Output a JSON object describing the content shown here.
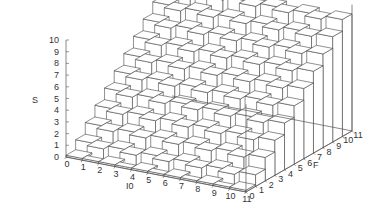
{
  "chart_data": {
    "type": "surface3d",
    "style": "stepped boxes (hidden-line)",
    "title": "",
    "xlabel": "I0",
    "ylabel": "F",
    "zlabel": "S",
    "x_ticks": [
      0,
      1,
      2,
      3,
      4,
      5,
      6,
      7,
      8,
      9,
      10,
      11
    ],
    "y_ticks": [
      0,
      1,
      2,
      3,
      4,
      5,
      6,
      7,
      8,
      9,
      10,
      11
    ],
    "z_ticks": [
      0,
      1,
      2,
      3,
      4,
      5,
      6,
      7,
      8,
      9,
      10
    ],
    "xlim": [
      0,
      11
    ],
    "ylim": [
      0,
      11
    ],
    "zlim": [
      0,
      10
    ],
    "grid": false,
    "legend": null,
    "surface_rule": "S increases by 1 per unit of F (S ≈ F), staircase with alternating offsets along I0",
    "x": [
      0,
      1,
      2,
      3,
      4,
      5,
      6,
      7,
      8,
      9,
      10
    ],
    "y": [
      0,
      1,
      2,
      3,
      4,
      5,
      6,
      7,
      8,
      9,
      10
    ],
    "z_by_F": [
      0,
      1,
      2,
      3,
      4,
      5,
      6,
      7,
      8,
      9,
      10
    ]
  },
  "colors": {
    "line": "#444444",
    "axis": "#555555",
    "text": "#333333",
    "background": "#ffffff"
  }
}
